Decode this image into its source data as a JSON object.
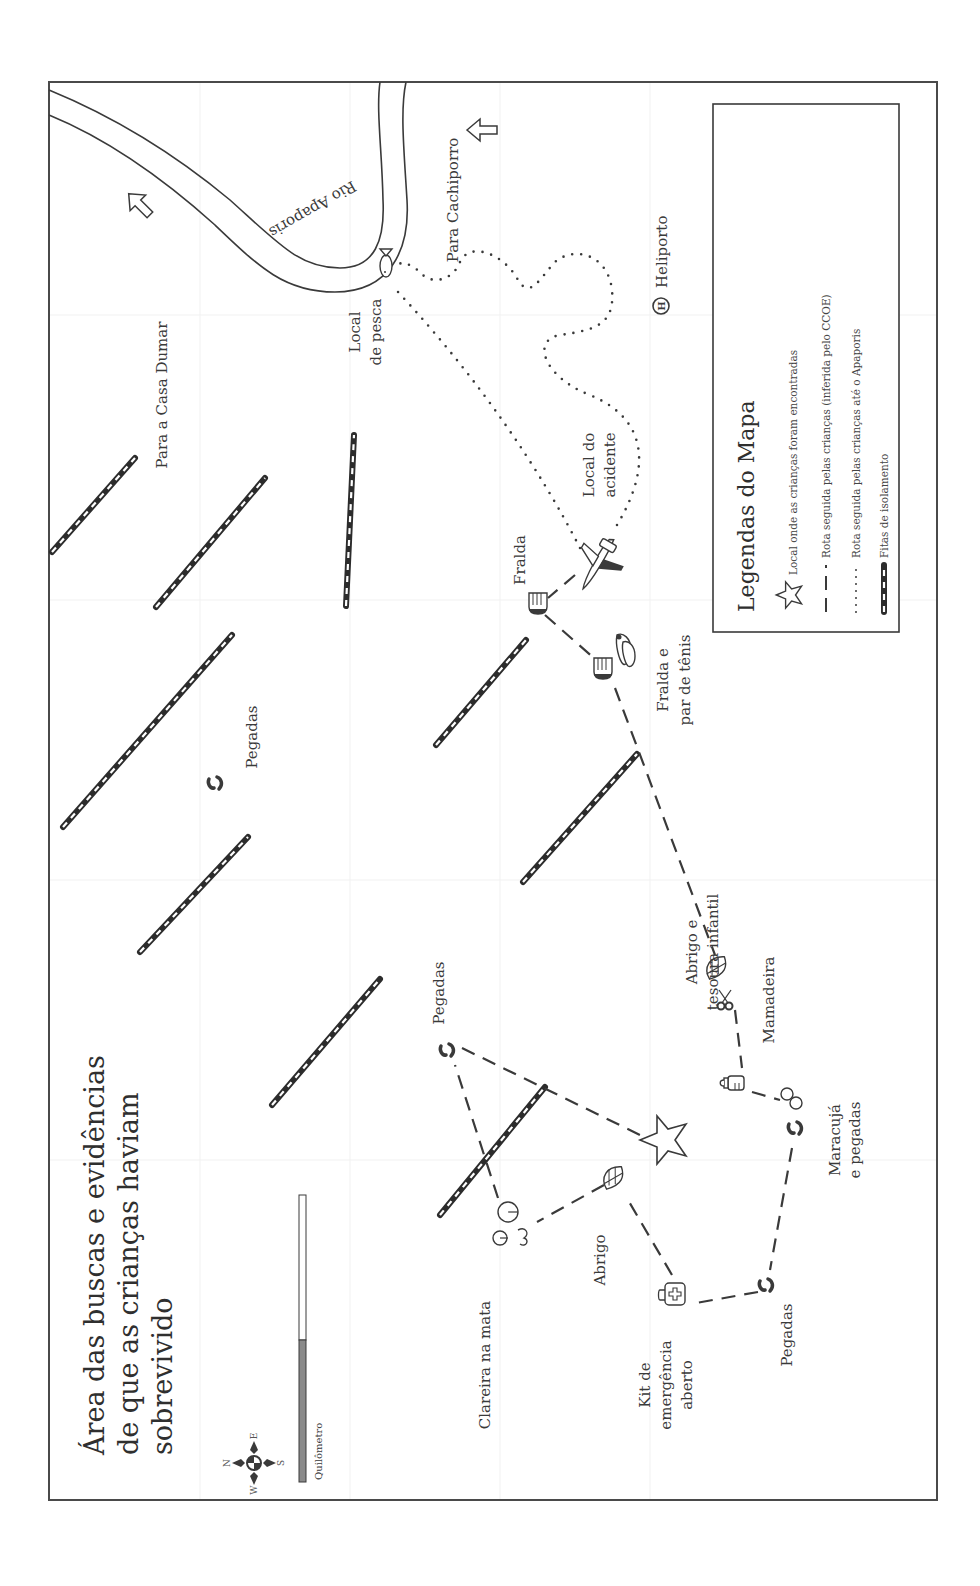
{
  "title": {
    "lines": [
      "Área das buscas e evidências",
      "de que as crianças haviam",
      "sobrevivido"
    ]
  },
  "compass": {
    "n": "N",
    "s": "S",
    "e": "E",
    "w": "W"
  },
  "scale": {
    "label": "Quilômetro"
  },
  "river": {
    "label": "Rio Apaporis"
  },
  "directions": {
    "casa_dumar": "Para a Casa Dumar",
    "cachiporro": "Para Cachiporro"
  },
  "places": {
    "local_pesca": [
      "Local",
      "de pesca"
    ],
    "heliporto": "Heliporto",
    "local_acidente": [
      "Local do",
      "acidente"
    ],
    "fralda": "Fralda",
    "fralda_tenis": [
      "Fralda e",
      "par de tênis"
    ],
    "pegadas_center": "Pegadas",
    "pegadas_top": "Pegadas",
    "abrigo_tesoura": [
      "Abrigo e",
      "tesoura infantil"
    ],
    "mamadeira": "Mamadeira",
    "maracuja": [
      "Maracujá",
      "e pegadas"
    ],
    "clareira": "Clareira na mata",
    "abrigo": "Abrigo",
    "kit": [
      "Kit de",
      "emergência",
      "aberto"
    ],
    "pegadas_bottom": "Pegadas"
  },
  "legend": {
    "title": "Legendas do Mapa",
    "items": [
      {
        "icon": "star-icon",
        "label": "Local onde as crianças foram encontradas"
      },
      {
        "icon": "dashed-line-icon",
        "label": "Rota seguida pelas crianças (inferida pelo CCOE)"
      },
      {
        "icon": "dotted-line-icon",
        "label": "Rota seguida pelas crianças até o Apaporis"
      },
      {
        "icon": "tape-line-icon",
        "label": "Fitas de isolamento"
      }
    ]
  },
  "colors": {
    "ink": "#3a3a3a",
    "frame": "#4a4a4a",
    "scale_fill": "#8a8a8a",
    "background": "#ffffff"
  }
}
